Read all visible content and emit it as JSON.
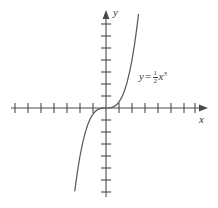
{
  "figure": {
    "background_color": "#ffffff",
    "stroke_color": "#5a5a5a",
    "axis_color": "#4a4a4a",
    "text_color": "#3a3a3a",
    "x_axis_label": "x",
    "y_axis_label": "y",
    "equation": {
      "lhs": "y",
      "relation": "=",
      "coefficient_numerator": "1",
      "coefficient_denominator": "2",
      "variable": "x",
      "exponent": "3",
      "full_text": "y = 1/2 x^3"
    }
  },
  "chart_data": {
    "type": "line",
    "title": "",
    "xlabel": "x",
    "ylabel": "y",
    "grid": false,
    "legend": false,
    "annotations": [
      {
        "text": "y = 1/2 x^3",
        "x": 2.6,
        "y": 3.2
      }
    ],
    "axis": {
      "origin_px": [
        106,
        108
      ],
      "x_tick_spacing_px": 13,
      "y_tick_spacing_px": 12,
      "x_ticks_left": 7,
      "x_ticks_right": 7,
      "y_ticks_above": 7,
      "y_ticks_below": 7,
      "xlim": [
        -7.3,
        7.6
      ],
      "ylim": [
        -7.5,
        8.0
      ],
      "x_axis_start_px": 11,
      "x_axis_end_px": 208,
      "y_axis_top_px": 10,
      "y_axis_bottom_px": 197
    },
    "series": [
      {
        "name": "y = 1/2 x^3",
        "expression": "0.5 * x^3",
        "x": [
          -2.4,
          -2.2,
          -2.0,
          -1.8,
          -1.6,
          -1.4,
          -1.2,
          -1.0,
          -0.8,
          -0.6,
          -0.4,
          -0.2,
          0.0,
          0.2,
          0.4,
          0.6,
          0.8,
          1.0,
          1.2,
          1.4,
          1.6,
          1.8,
          2.0,
          2.2,
          2.4,
          2.5
        ],
        "values": [
          -6.91,
          -5.32,
          -4.0,
          -2.92,
          -2.05,
          -1.37,
          -0.86,
          -0.5,
          -0.26,
          -0.11,
          -0.03,
          -0.004,
          0.0,
          0.004,
          0.03,
          0.11,
          0.26,
          0.5,
          0.86,
          1.37,
          2.05,
          2.92,
          4.0,
          5.32,
          6.91,
          7.81
        ]
      }
    ]
  }
}
